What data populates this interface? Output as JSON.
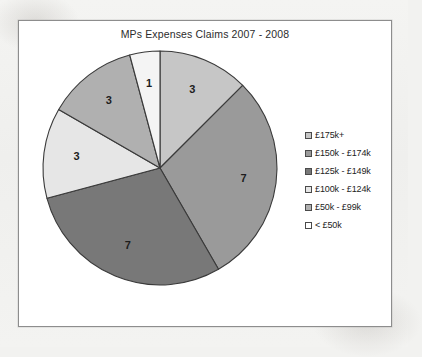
{
  "chart_data": {
    "type": "pie",
    "title": "MPs Expenses Claims 2007 - 2008",
    "xlabel": "",
    "ylabel": "",
    "legend_position": "right",
    "grid": false,
    "total": 24,
    "start_angle_deg": 0,
    "direction": "clockwise",
    "categories": [
      "£175k+",
      "£150k -  £174k",
      "£125k -  £149k",
      "£100k -  £124k",
      "£50k -  £99k",
      "< £50k"
    ],
    "values": [
      3,
      7,
      7,
      3,
      3,
      1
    ],
    "labels": [
      "3",
      "7",
      "7",
      "3",
      "3",
      "1"
    ],
    "colors": [
      "#c6c6c6",
      "#9a9a9a",
      "#787878",
      "#e6e6e6",
      "#b0b0b0",
      "#f4f4f4"
    ],
    "slices": [
      {
        "name": "£175k+",
        "value": 3,
        "label": "3",
        "color": "#c6c6c6"
      },
      {
        "name": "£150k -  £174k",
        "value": 7,
        "label": "7",
        "color": "#9a9a9a"
      },
      {
        "name": "£125k -  £149k",
        "value": 7,
        "label": "7",
        "color": "#787878"
      },
      {
        "name": "£100k -  £124k",
        "value": 3,
        "label": "3",
        "color": "#e6e6e6"
      },
      {
        "name": "£50k -  £99k",
        "value": 3,
        "label": "3",
        "color": "#b0b0b0"
      },
      {
        "name": "< £50k",
        "value": 1,
        "label": "1",
        "color": "#f4f4f4"
      }
    ]
  },
  "legend": {
    "items": [
      {
        "label": "£175k+",
        "color": "#c6c6c6"
      },
      {
        "label": "£150k -  £174k",
        "color": "#9a9a9a"
      },
      {
        "label": "£125k -  £149k",
        "color": "#787878"
      },
      {
        "label": "£100k -  £124k",
        "color": "#e6e6e6"
      },
      {
        "label": "£50k -  £99k",
        "color": "#b0b0b0"
      },
      {
        "label": "< £50k",
        "color": "#ffffff"
      }
    ]
  }
}
